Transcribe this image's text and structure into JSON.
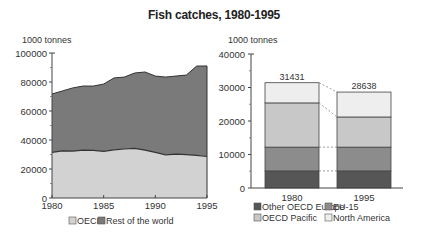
{
  "title": "Fish catches, 1980-1995",
  "colors": {
    "oecd": "#d2d2d2",
    "rest_of_world": "#7a7a7a",
    "other_oecd_europe": "#565656",
    "eu15": "#8c8c8c",
    "oecd_pacific": "#c8c8c8",
    "north_america": "#eeeeee",
    "line": "#333333"
  },
  "chart_data": [
    {
      "type": "area",
      "stacked": true,
      "title": "Fish catches, 1980-1995",
      "ylabel": "1000 tonnes",
      "xlabel": "",
      "x": [
        1980,
        1981,
        1982,
        1983,
        1984,
        1985,
        1986,
        1987,
        1988,
        1989,
        1990,
        1991,
        1992,
        1993,
        1994,
        1995
      ],
      "x_ticks": [
        "1980",
        "1985",
        "1990",
        "1995"
      ],
      "y_ticks": [
        "0",
        "20000",
        "40000",
        "60000",
        "80000",
        "100000"
      ],
      "ylim": [
        0,
        100000
      ],
      "series": [
        {
          "name": "OECD",
          "values": [
            31431,
            32500,
            32300,
            33000,
            32800,
            32200,
            33200,
            33800,
            34200,
            33000,
            31500,
            29800,
            30200,
            29900,
            29400,
            28638
          ]
        },
        {
          "name": "Rest of the world",
          "values": [
            40300,
            41300,
            43600,
            44200,
            44400,
            46400,
            49600,
            49600,
            52000,
            53900,
            52600,
            53600,
            53900,
            54900,
            61600,
            62400
          ]
        }
      ],
      "totals": [
        71731,
        73800,
        75900,
        77200,
        77200,
        78600,
        82800,
        83400,
        86200,
        86900,
        84100,
        83400,
        84100,
        84800,
        91000,
        91038
      ],
      "legend": [
        "OECD",
        "Rest of the world"
      ],
      "legend_position": "bottom",
      "grid": false
    },
    {
      "type": "bar",
      "stacked": true,
      "ylabel": "1000 tonnes",
      "categories": [
        "1980",
        "1995"
      ],
      "y_ticks": [
        "0",
        "10000",
        "20000",
        "30000",
        "40000"
      ],
      "ylim": [
        0,
        40000
      ],
      "series": [
        {
          "name": "Other OECD Europe",
          "values": [
            5100,
            5100
          ]
        },
        {
          "name": "EU-15",
          "values": [
            7100,
            7100
          ]
        },
        {
          "name": "OECD Pacific",
          "values": [
            13200,
            9000
          ]
        },
        {
          "name": "North America",
          "values": [
            6031,
            7438
          ]
        }
      ],
      "totals": [
        31431,
        28638
      ],
      "total_labels": [
        "31431",
        "28638"
      ],
      "legend": [
        "Other OECD Europe",
        "EU-15",
        "OECD Pacific",
        "North America"
      ],
      "legend_position": "bottom",
      "grid": false
    }
  ]
}
